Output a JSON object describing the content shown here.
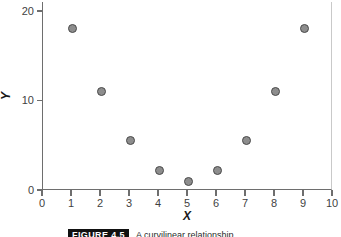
{
  "chart_data": {
    "type": "scatter",
    "title": "",
    "xlabel": "X",
    "ylabel": "Y",
    "xlim": [
      0,
      10
    ],
    "ylim": [
      0,
      21
    ],
    "grid": false,
    "legend": null,
    "xticks": [
      0,
      1,
      2,
      3,
      4,
      5,
      6,
      7,
      8,
      9,
      10
    ],
    "xticklabels": [
      "0",
      "1",
      "2",
      "3",
      "4",
      "5",
      "6",
      "7",
      "8",
      "9",
      "10"
    ],
    "yticks": [
      0,
      10,
      20
    ],
    "yticklabels": [
      "0",
      "10",
      "20"
    ],
    "marker": {
      "shape": "circle",
      "fill": "#8d8d8d",
      "edge": "#4a4a4a",
      "size_px": 9
    },
    "series": [
      {
        "name": "observations",
        "x": [
          1,
          2,
          3,
          4,
          5,
          6,
          7,
          8,
          9
        ],
        "y": [
          18,
          11,
          5.5,
          2.2,
          1,
          2.2,
          5.5,
          11,
          18
        ],
        "points": [
          {
            "x": 1,
            "y": 18
          },
          {
            "x": 2,
            "y": 11
          },
          {
            "x": 3,
            "y": 5.5
          },
          {
            "x": 4,
            "y": 2.2
          },
          {
            "x": 5,
            "y": 1
          },
          {
            "x": 6,
            "y": 2.2
          },
          {
            "x": 7,
            "y": 5.5
          },
          {
            "x": 8,
            "y": 11
          },
          {
            "x": 9,
            "y": 18
          }
        ]
      }
    ]
  },
  "caption": {
    "tag": "FIGURE 4.5",
    "text": "A curvilinear relationship."
  }
}
